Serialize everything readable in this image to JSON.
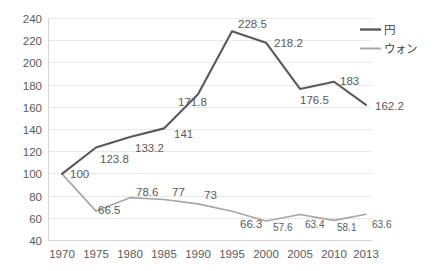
{
  "chart_data": {
    "type": "line",
    "title": "",
    "xlabel": "",
    "ylabel": "",
    "categories": [
      "1970",
      "1975",
      "1980",
      "1985",
      "1990",
      "1995",
      "2000",
      "2005",
      "2010",
      "2013"
    ],
    "ylim": [
      40,
      240
    ],
    "ytick_step": 20,
    "yticks": [
      "240",
      "220",
      "200",
      "180",
      "160",
      "140",
      "120",
      "100",
      "80",
      "60",
      "40"
    ],
    "grid": true,
    "legend_position": "right-top",
    "series": [
      {
        "name": "円",
        "color": "#595959",
        "values": [
          100,
          123.8,
          133.2,
          141,
          171.8,
          228.5,
          218.2,
          176.5,
          183,
          162.2
        ],
        "labels": [
          "100",
          "123.8",
          "133.2",
          "141",
          "171.8",
          "228.5",
          "218.2",
          "176.5",
          "183",
          "162.2"
        ]
      },
      {
        "name": "ウォン",
        "color": "#a6a6a6",
        "values": [
          100,
          66.5,
          78.6,
          77,
          73,
          66.3,
          57.6,
          63.4,
          58.1,
          63.6
        ],
        "labels": [
          "100",
          "66.5",
          "78.6",
          "77",
          "73",
          "66.3",
          "57.6",
          "63.4",
          "58.1",
          "63.6"
        ]
      }
    ]
  },
  "legend": {
    "items": [
      {
        "label": "円"
      },
      {
        "label": "ウォン"
      }
    ]
  },
  "axis": {
    "y_labels": [
      "240",
      "220",
      "200",
      "180",
      "160",
      "140",
      "120",
      "100",
      "80",
      "60",
      "40"
    ],
    "x_labels": [
      "1970",
      "1975",
      "1980",
      "1985",
      "1990",
      "1995",
      "2000",
      "2005",
      "2010",
      "2013"
    ]
  },
  "data_labels": {
    "yen": {
      "v1970": "100",
      "v1975": "123.8",
      "v1980": "133.2",
      "v1985": "141",
      "v1990": "171.8",
      "v1995": "228.5",
      "v2000": "218.2",
      "v2005": "176.5",
      "v2010": "183",
      "v2013": "162.2"
    },
    "won": {
      "v1975": "66.5",
      "v1980": "78.6",
      "v1985": "77",
      "v1990": "73",
      "v1995": "66.3",
      "v2000": "57.6",
      "v2005": "63.4",
      "v2010": "58.1",
      "v2013": "63.6"
    }
  }
}
